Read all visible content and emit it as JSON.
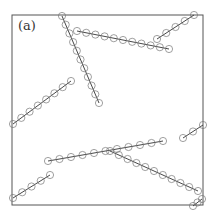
{
  "panel_label": "(a)",
  "frame": {
    "x": 12,
    "y": 15,
    "width": 191,
    "height": 190,
    "stroke": "#555555"
  },
  "colors": {
    "chain_line": "#333333",
    "bead_stroke": "#777777"
  },
  "bead_radius": 3.6,
  "chains": [
    {
      "id": "chain-1",
      "start": [
        62,
        16
      ],
      "end": [
        99,
        103
      ],
      "beads": 11
    },
    {
      "id": "chain-2",
      "start": [
        77,
        31
      ],
      "end": [
        169,
        49
      ],
      "beads": 11
    },
    {
      "id": "chain-3",
      "start": [
        157,
        39
      ],
      "end": [
        194,
        15
      ],
      "beads": 5
    },
    {
      "id": "chain-4",
      "start": [
        13,
        124
      ],
      "end": [
        71,
        81
      ],
      "beads": 8
    },
    {
      "id": "chain-5",
      "start": [
        48,
        161
      ],
      "end": [
        163,
        141
      ],
      "beads": 11
    },
    {
      "id": "chain-6",
      "start": [
        13,
        198
      ],
      "end": [
        50,
        175
      ],
      "beads": 5
    },
    {
      "id": "chain-7",
      "start": [
        183,
        138
      ],
      "end": [
        203,
        125
      ],
      "beads": 3
    },
    {
      "id": "chain-8",
      "start": [
        110,
        151
      ],
      "end": [
        198,
        191
      ],
      "beads": 11
    },
    {
      "id": "chain-9",
      "start": [
        193,
        206
      ],
      "end": [
        202,
        199
      ],
      "beads": 3
    }
  ]
}
